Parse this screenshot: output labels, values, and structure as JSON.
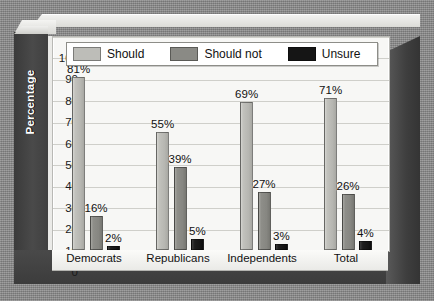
{
  "chart_data": {
    "type": "bar",
    "title": "",
    "xlabel": "Affiliation",
    "ylabel": "Percentage",
    "categories": [
      "Democrats",
      "Republicans",
      "Independents",
      "Total"
    ],
    "series": [
      {
        "name": "Should",
        "color": "#bdbdb8",
        "values": [
          81,
          55,
          69,
          71
        ],
        "labels": [
          "81%",
          "55%",
          "69%",
          "71%"
        ]
      },
      {
        "name": "Should not",
        "color": "#8a8a85",
        "values": [
          16,
          39,
          27,
          26
        ],
        "labels": [
          "16%",
          "39%",
          "27%",
          "26%"
        ]
      },
      {
        "name": "Unsure",
        "color": "#151515",
        "values": [
          2,
          5,
          3,
          4
        ],
        "labels": [
          "2%",
          "5%",
          "3%",
          "4%"
        ]
      }
    ],
    "ylim": [
      0,
      100
    ],
    "yticks": [
      0,
      10,
      20,
      30,
      40,
      50,
      60,
      70,
      80,
      90,
      100
    ],
    "ytick_labels": [
      "0",
      "10",
      "20",
      "30",
      "40",
      "50",
      "60",
      "70",
      "80",
      "90",
      "100"
    ],
    "grid": true,
    "legend_position": "top-inside",
    "value_labels": true,
    "style_3d": true
  }
}
